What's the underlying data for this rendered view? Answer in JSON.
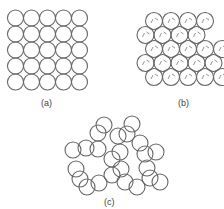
{
  "figure": {
    "panels": [
      {
        "id": "a",
        "label": "(a)",
        "description": "square packing",
        "rows": 5,
        "cols": 5
      },
      {
        "id": "b",
        "label": "(b)",
        "description": "hexagonal close packing",
        "rows": 5,
        "cols": "4-5 staggered"
      },
      {
        "id": "c",
        "label": "(c)",
        "description": "random packing"
      }
    ]
  },
  "style": {
    "stroke": "#666666",
    "fill": "#ffffff",
    "dash_stroke": "#777777"
  },
  "panel_a": {
    "origin": [
      7.5,
      10
    ],
    "pitch": 16,
    "r": 8
  },
  "panel_b": {
    "rows": [
      {
        "y": 21,
        "x0": 154,
        "n": 4
      },
      {
        "y": 35,
        "x0": 145.5,
        "n": 4
      },
      {
        "y": 49,
        "x0": 154,
        "n": 5
      },
      {
        "y": 63,
        "x0": 145.5,
        "n": 5
      },
      {
        "y": 77,
        "x0": 154,
        "n": 5
      }
    ],
    "pitch": 17,
    "r": 8.5
  },
  "panel_c": {
    "r": 8,
    "circles": [
      [
        104,
        125
      ],
      [
        132,
        124
      ],
      [
        98,
        133
      ],
      [
        118,
        136
      ],
      [
        127,
        134
      ],
      [
        73,
        150
      ],
      [
        86,
        148
      ],
      [
        98,
        149
      ],
      [
        120,
        152
      ],
      [
        140,
        143
      ],
      [
        145,
        154
      ],
      [
        156,
        152
      ],
      [
        76,
        169
      ],
      [
        112,
        159
      ],
      [
        121,
        169
      ],
      [
        147,
        168
      ],
      [
        80,
        179
      ],
      [
        87,
        187
      ],
      [
        99,
        183
      ],
      [
        112,
        175
      ],
      [
        125,
        182
      ],
      [
        137,
        187
      ],
      [
        150,
        178
      ],
      [
        160,
        182
      ]
    ]
  }
}
